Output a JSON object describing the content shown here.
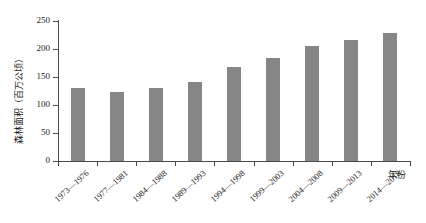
{
  "chart_data": {
    "type": "bar",
    "title": "",
    "subtitle": "",
    "xlabel": "年份",
    "ylabel": "森林面积（百万公顷）",
    "categories": [
      "1973—1976",
      "1977—1981",
      "1984—1988",
      "1989—1993",
      "1994—1998",
      "1999—2003",
      "2004—2008",
      "2009—2013",
      "2014—2018"
    ],
    "values": [
      130,
      124,
      131,
      141,
      167,
      184,
      206,
      216,
      228
    ],
    "ylim": [
      0,
      250
    ],
    "yticks": [
      0,
      50,
      100,
      150,
      200,
      250
    ],
    "ytick_labels": [
      "0",
      "50",
      "100",
      "150",
      "200",
      "250"
    ],
    "grid": false,
    "legend": false,
    "bar_color": "#868686",
    "axis_color": "#4a4a4a",
    "text_color": "#1b1b1b"
  }
}
